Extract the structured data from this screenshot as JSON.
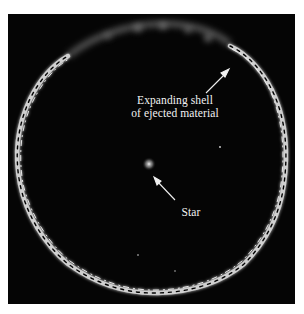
{
  "figure": {
    "background_color": "#050505",
    "ring_color": "#e8e8e8",
    "annotations": [
      {
        "id": "shell",
        "lines": [
          "Expanding shell",
          "of ejected material"
        ]
      },
      {
        "id": "star",
        "lines": [
          "Star"
        ]
      }
    ]
  }
}
